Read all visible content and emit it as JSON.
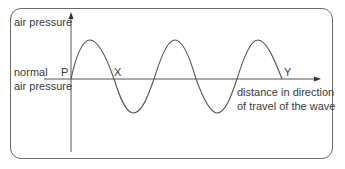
{
  "diagram": {
    "type": "transverse representation of a longitudinal sound wave",
    "y_axis_label": "air pressure",
    "baseline_label_line1": "normal",
    "baseline_label_line2": "air pressure",
    "x_axis_label_line1": "distance in direction",
    "x_axis_label_line2": "of travel of the wave",
    "points": {
      "P": "P",
      "X": "X",
      "Y": "Y"
    },
    "wave": {
      "cycles": 2.5,
      "description": "sine wave starting at P on the baseline, peaks three times, troughs twice, ending at Y on the baseline"
    },
    "colors": {
      "line": "#555555",
      "text": "#3a3a3a",
      "frame": "#6b6b6b"
    }
  }
}
